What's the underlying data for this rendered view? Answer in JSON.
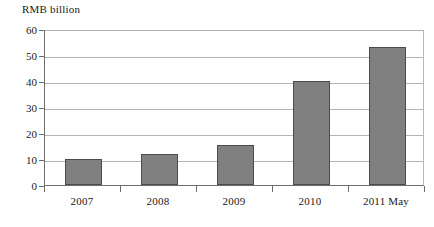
{
  "chart_data": {
    "type": "bar",
    "title": "",
    "subtitle": "",
    "xlabel": "",
    "ylabel": "RMB billion",
    "categories": [
      "2007",
      "2008",
      "2009",
      "2010",
      "2011 May"
    ],
    "values": [
      10,
      12,
      15.5,
      40,
      53
    ],
    "series": [
      {
        "name": "",
        "values": [
          10,
          12,
          15.5,
          40,
          53
        ]
      }
    ],
    "ylim": [
      0,
      60
    ],
    "yticks": [
      0,
      10,
      20,
      30,
      40,
      50,
      60
    ],
    "ytick_labels": [
      "0",
      "10",
      "20",
      "30",
      "40",
      "50",
      "60"
    ],
    "grid": true,
    "legend": false,
    "legend_position": "none",
    "bar_color": "#808080",
    "bar_edge_color": "#4c4c4c",
    "axis_color": "#6e6e6e",
    "gridline_color": "#b5b5b5",
    "background_color": "#ffffff"
  }
}
